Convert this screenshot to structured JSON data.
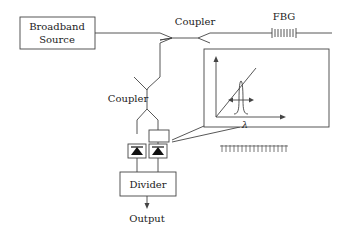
{
  "diagram": {
    "source_label_line1": "Broadband",
    "source_label_line2": "Source",
    "coupler_top_label": "Coupler",
    "coupler_mid_label": "Coupler",
    "fbg_label": "FBG",
    "divider_label": "Divider",
    "output_label": "Output",
    "inset_axis_label": "λ",
    "colors": {
      "line": "#444444",
      "text": "#222222",
      "background": "#ffffff"
    }
  }
}
